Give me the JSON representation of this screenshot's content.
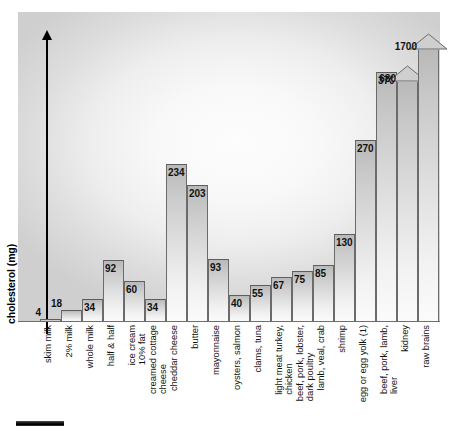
{
  "chart_data": {
    "type": "bar",
    "title": "",
    "xlabel": "",
    "ylabel": "cholesterol (mg)",
    "ylim": [
      0,
      440
    ],
    "grid": false,
    "legend": null,
    "note": "Final two bars are drawn with up-arrow heads indicating values extend beyond the plot area.",
    "categories": [
      "skim milk",
      "2% milk",
      "whole milk",
      "half & half",
      "ice cream\n10% fat",
      "creamed cottage\ncheese",
      "cheddar cheese",
      "butter",
      "mayonnaise",
      "oysters, salmon",
      "clams, tuna",
      "light meat turkey,\nchicken",
      "beef, pork, lobster,\ndark poultry",
      "lamb, veal, crab",
      "shrimp",
      "egg or egg yolk (1)",
      "beef, pork, lamb,\nliver",
      "kidney",
      "raw brains"
    ],
    "values": [
      4,
      18,
      34,
      92,
      60,
      34,
      234,
      203,
      93,
      40,
      55,
      67,
      75,
      85,
      130,
      270,
      370,
      680,
      1700
    ],
    "value_labels": [
      "4",
      "18",
      "34",
      "92",
      "60",
      "34",
      "234",
      "203",
      "93",
      "40",
      "55",
      "67",
      "75",
      "85",
      "130",
      "270",
      "370",
      "680",
      "1700"
    ],
    "off_scale": [
      false,
      false,
      false,
      false,
      false,
      false,
      false,
      false,
      false,
      false,
      false,
      false,
      false,
      false,
      false,
      false,
      false,
      true,
      true
    ]
  },
  "axis": {
    "y_title": "cholesterol (mg)"
  },
  "decorations": {
    "scale_bar": "scale-bar"
  }
}
